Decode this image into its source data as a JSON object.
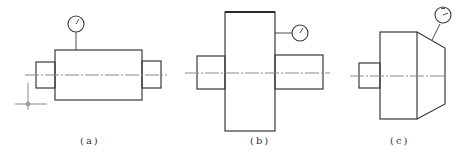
{
  "figure": {
    "colors": {
      "outline": "#3a3a3a",
      "centerline": "#8a8a8a",
      "background": "#ffffff"
    },
    "subfigures": [
      {
        "id": "a",
        "label": "(a)",
        "shape": "stepped-shaft",
        "indicator_position": "top of main cylinder, radial",
        "has_datum_crosshair": true
      },
      {
        "id": "b",
        "label": "(b)",
        "shape": "disc-on-shaft",
        "indicator_position": "side of disc, axial face"
      },
      {
        "id": "c",
        "label": "(c)",
        "shape": "cylinder-with-taper",
        "indicator_position": "normal to tapered surface"
      }
    ]
  }
}
